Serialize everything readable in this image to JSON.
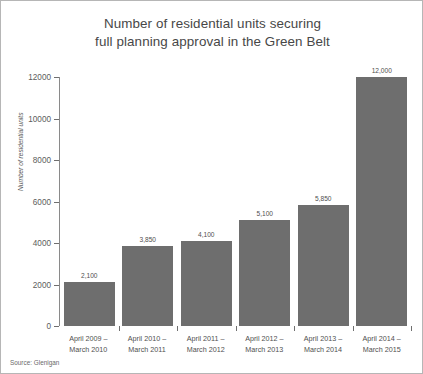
{
  "figure": {
    "source_note": "Source: Glenigan"
  },
  "chart_data": {
    "type": "bar",
    "title": "Number of residential units securing full planning approval in the Green Belt",
    "title_lines": [
      "Number of residential units securing",
      "full planning approval in the Green Belt"
    ],
    "xlabel": "",
    "ylabel": "Number of residential units",
    "ylim": [
      0,
      12000
    ],
    "yticks": [
      0,
      2000,
      4000,
      6000,
      8000,
      10000,
      12000
    ],
    "ytick_labels": [
      "0",
      "2000",
      "4000",
      "6000",
      "8000",
      "10000",
      "12000"
    ],
    "grid": false,
    "legend": false,
    "categories": [
      "April 2009 – March 2010",
      "April 2010 – March 2011",
      "April 2011 – March 2012",
      "April 2012 – March 2013",
      "April 2013 – March 2014",
      "April 2014 – March 2015"
    ],
    "category_lines": [
      [
        "April 2009 –",
        "March 2010"
      ],
      [
        "April 2010 –",
        "March 2011"
      ],
      [
        "April 2011 –",
        "March 2012"
      ],
      [
        "April 2012 –",
        "March 2013"
      ],
      [
        "April 2013 –",
        "March 2014"
      ],
      [
        "April 2014 –",
        "March 2015"
      ]
    ],
    "values": [
      2100,
      3850,
      4100,
      5100,
      5850,
      12000
    ],
    "value_labels": [
      "2,100",
      "3,850",
      "4,100",
      "5,100",
      "5,850",
      "12,000"
    ],
    "bar_color": "#6e6e6e",
    "axis_color": "#8a8a8a",
    "text_color": "#4f4f4f"
  }
}
